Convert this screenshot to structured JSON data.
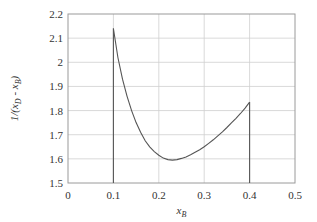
{
  "chart_data": {
    "type": "line",
    "title": "",
    "xlabel": "x_B",
    "ylabel": "1/(x_D - x_B)",
    "xlim": [
      0,
      0.5
    ],
    "ylim": [
      1.5,
      2.2
    ],
    "grid": true,
    "x_ticks": [
      0,
      0.1,
      0.2,
      0.3,
      0.4,
      0.5
    ],
    "x_tick_labels": [
      "0",
      "0.1",
      "0.2",
      "0.3",
      "0.4",
      "0.5"
    ],
    "y_ticks": [
      1.5,
      1.6,
      1.7,
      1.8,
      1.9,
      2.0,
      2.1,
      2.2
    ],
    "y_tick_labels": [
      "1.5",
      "1.6",
      "1.7",
      "1.8",
      "1.9",
      "2",
      "2.1",
      "2.2"
    ],
    "series": [
      {
        "name": "1/(x_D - x_B)",
        "x": [
          0.1,
          0.11,
          0.12,
          0.13,
          0.14,
          0.15,
          0.16,
          0.17,
          0.18,
          0.19,
          0.2,
          0.21,
          0.22,
          0.23,
          0.24,
          0.25,
          0.26,
          0.27,
          0.28,
          0.29,
          0.3,
          0.31,
          0.32,
          0.33,
          0.34,
          0.35,
          0.36,
          0.37,
          0.38,
          0.39,
          0.4
        ],
        "y": [
          2.14,
          2.02,
          1.93,
          1.86,
          1.8,
          1.75,
          1.71,
          1.675,
          1.65,
          1.63,
          1.615,
          1.603,
          1.597,
          1.595,
          1.597,
          1.602,
          1.608,
          1.617,
          1.627,
          1.638,
          1.65,
          1.664,
          1.679,
          1.695,
          1.712,
          1.73,
          1.749,
          1.768,
          1.788,
          1.81,
          1.835
        ]
      }
    ],
    "vertical_lines": [
      {
        "x": 0.1,
        "y_from": 1.5,
        "y_to": 2.14
      },
      {
        "x": 0.4,
        "y_from": 1.5,
        "y_to": 1.835
      }
    ],
    "legend": "none"
  }
}
